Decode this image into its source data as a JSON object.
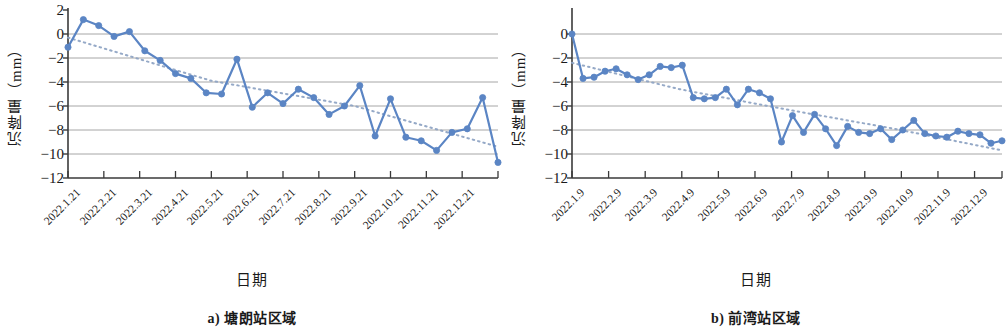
{
  "figure": {
    "y_axis_label": "沉降量（mm）",
    "x_axis_label": "日期",
    "series_color": "#5b85c4",
    "trend_color": "#8fa4c4",
    "grid_color": "#8c8c8c",
    "axis_color": "#3a3a3a"
  },
  "panels": [
    {
      "caption": "a) 塘朗站区域",
      "x_axis_label": "日期",
      "y_axis_label": "沉降量（mm）"
    },
    {
      "caption": "b) 前湾站区域",
      "x_axis_label": "日期",
      "y_axis_label": "沉降量（mm）"
    }
  ],
  "chart_data": [
    {
      "type": "line",
      "title": "a) 塘朗站区域",
      "xlabel": "日期",
      "ylabel": "沉降量（mm）",
      "ylim": [
        -12,
        2
      ],
      "yticks": [
        2,
        0,
        -2,
        -4,
        -6,
        -8,
        -10,
        -12
      ],
      "ytick_labels": [
        "2",
        "0",
        "−2",
        "−4",
        "−6",
        "−8",
        "−10",
        "−12"
      ],
      "grid": true,
      "legend": "none",
      "xtick_labels": [
        "2022.1.21",
        "2022.2.21",
        "2022.3.21",
        "2022.4.21",
        "2022.5.21",
        "2022.6.21",
        "2022.7.21",
        "2022.8.21",
        "2022.9.21",
        "2022.10.21",
        "2022.11.21",
        "2022.12.21"
      ],
      "xtick_positions": [
        0,
        3,
        6,
        9,
        12,
        15,
        18,
        21,
        24,
        27,
        30,
        33
      ],
      "x_index_range": [
        0,
        36
      ],
      "series": [
        {
          "name": "沉降量",
          "marker": "circle",
          "values": [
            -1.1,
            1.2,
            0.7,
            -0.2,
            0.2,
            -1.4,
            -2.2,
            -3.3,
            -3.7,
            -4.9,
            -5.0,
            -2.1,
            -6.1,
            -4.9,
            -5.8,
            -4.6,
            -5.3,
            -6.7,
            -6.0,
            -4.3,
            -8.5,
            -5.4,
            -8.6,
            -8.9,
            -9.7,
            -8.2,
            -7.9,
            -5.3,
            -10.7
          ]
        },
        {
          "name": "趋势线",
          "style": "dotted",
          "values": [
            -0.3,
            -3.9,
            -6.0,
            -9.4
          ]
        }
      ]
    },
    {
      "type": "line",
      "title": "b) 前湾站区域",
      "xlabel": "日期",
      "ylabel": "沉降量（mm）",
      "ylim": [
        -12,
        0
      ],
      "yticks": [
        0,
        -2,
        -4,
        -6,
        -8,
        -10,
        -12
      ],
      "ytick_labels": [
        "0",
        "−2",
        "−4",
        "−6",
        "−8",
        "−10",
        "−12"
      ],
      "grid": true,
      "legend": "none",
      "xtick_labels": [
        "2022.1.9",
        "2022.2.9",
        "2022.3.9",
        "2022.4.9",
        "2022.5.9",
        "2022.6.9",
        "2022.7.9",
        "2022.8.9",
        "2022.9.9",
        "2022.10.9",
        "2022.11.9",
        "2022.12.9"
      ],
      "xtick_positions": [
        0,
        4,
        8,
        12,
        16,
        20,
        24,
        28,
        32,
        36,
        40,
        44
      ],
      "x_index_range": [
        0,
        47
      ],
      "series": [
        {
          "name": "沉降量",
          "marker": "circle",
          "values": [
            0.0,
            -3.7,
            -3.6,
            -3.1,
            -2.9,
            -3.4,
            -3.8,
            -3.4,
            -2.7,
            -2.8,
            -2.6,
            -5.3,
            -5.4,
            -5.3,
            -4.6,
            -5.9,
            -4.6,
            -4.9,
            -5.4,
            -9.0,
            -6.8,
            -8.2,
            -6.7,
            -7.9,
            -9.3,
            -7.7,
            -8.2,
            -8.3,
            -7.9,
            -8.8,
            -8.0,
            -7.2,
            -8.3,
            -8.5,
            -8.6,
            -8.1,
            -8.3,
            -8.4,
            -9.1,
            -8.9
          ]
        },
        {
          "name": "趋势线",
          "style": "dotted",
          "values": [
            -2.4,
            -4.6,
            -6.3,
            -7.9,
            -9.7
          ]
        }
      ]
    }
  ]
}
